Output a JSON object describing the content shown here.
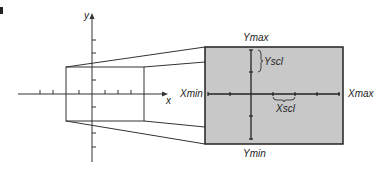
{
  "figure": {
    "corner_mark": "B",
    "left_axes": {
      "x_label": "x",
      "y_label": "y"
    },
    "window": {
      "ymax_label": "Ymax",
      "ymin_label": "Ymin",
      "xmin_label": "Xmin",
      "xmax_label": "Xmax",
      "yscl_label": "Yscl",
      "xscl_label": "Xscl",
      "fill_color": "#c8c8c8",
      "border_color": "#222222"
    },
    "line_color": "#333333"
  }
}
